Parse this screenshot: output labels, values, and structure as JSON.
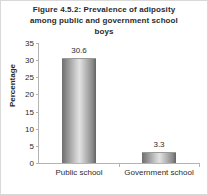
{
  "figure": {
    "title_lines": [
      "Figure 4.5.2: Prevalence of adiposity",
      "among public and government school",
      "boys"
    ],
    "border_color": "#d9d9d9",
    "background": "#ffffff"
  },
  "chart_data": {
    "type": "bar",
    "title": "Figure 4.5.2: Prevalence of adiposity among public and government school boys",
    "categories": [
      "Public school",
      "Government school"
    ],
    "values": [
      30.6,
      3.3
    ],
    "data_labels": [
      "30.6",
      "3.3"
    ],
    "xlabel": "",
    "ylabel": "Percentage",
    "ylim": [
      0,
      35
    ],
    "yticks": [
      0,
      5,
      10,
      15,
      20,
      25,
      30,
      35
    ],
    "ytick_labels": [
      "0",
      "5",
      "10",
      "15",
      "20",
      "25",
      "30",
      "35"
    ],
    "grid": false,
    "legend": false,
    "bar_style": "cylinder-gradient-gray",
    "bar_color_dark": "#6e6e6e",
    "bar_color_light": "#e2e2e2",
    "axis_color": "#b4b4b4",
    "text_color": "#2b2b2b"
  }
}
